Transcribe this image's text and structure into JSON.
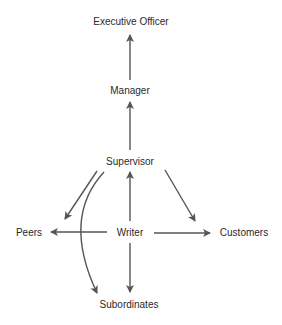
{
  "diagram": {
    "type": "communication-flow",
    "colors": {
      "arrow": "#555555",
      "text": "#2a2a2a",
      "background": "#ffffff"
    },
    "nodes": {
      "executive_officer": "Executive Officer",
      "manager": "Manager",
      "supervisor": "Supervisor",
      "writer": "Writer",
      "peers": "Peers",
      "customers": "Customers",
      "subordinates": "Subordinates"
    },
    "edges": [
      {
        "from": "Manager",
        "to": "Executive Officer",
        "style": "straight"
      },
      {
        "from": "Supervisor",
        "to": "Manager",
        "style": "straight"
      },
      {
        "from": "Writer",
        "to": "Supervisor",
        "style": "straight"
      },
      {
        "from": "Supervisor",
        "to": "Peers",
        "style": "straight"
      },
      {
        "from": "Supervisor",
        "to": "Subordinates",
        "style": "curved"
      },
      {
        "from": "Supervisor",
        "to": "Customers",
        "style": "straight"
      },
      {
        "from": "Writer",
        "to": "Peers",
        "style": "straight"
      },
      {
        "from": "Writer",
        "to": "Customers",
        "style": "straight"
      },
      {
        "from": "Writer",
        "to": "Subordinates",
        "style": "straight"
      }
    ]
  }
}
